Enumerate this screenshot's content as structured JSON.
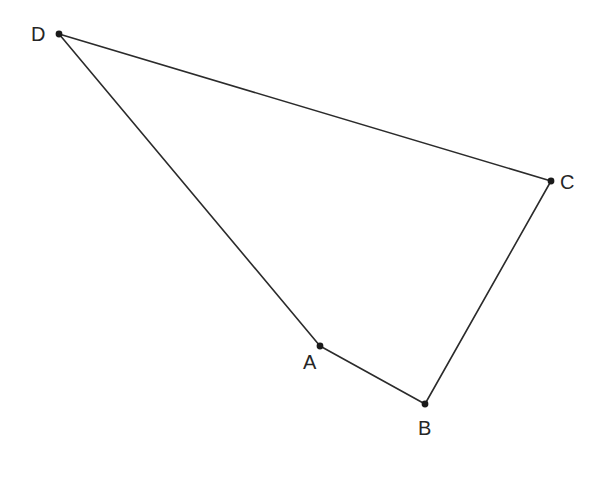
{
  "figure": {
    "background_color": "#ffffff",
    "stroke_color": "#2b2b2b",
    "stroke_width": 1.6,
    "vertex_dot_color": "#1a1a1a",
    "vertex_dot_radius": 3.4,
    "label_color": "#262626",
    "label_font_size": 20,
    "canvas": {
      "width": 604,
      "height": 477
    },
    "vertices": [
      {
        "id": "D",
        "label": "D",
        "x": 59,
        "y": 34,
        "label_x": 31,
        "label_y": 24,
        "label_position": "left"
      },
      {
        "id": "C",
        "label": "C",
        "x": 551,
        "y": 181,
        "label_x": 560,
        "label_y": 172,
        "label_position": "right"
      },
      {
        "id": "B",
        "label": "B",
        "x": 425,
        "y": 404,
        "label_x": 418,
        "label_y": 418,
        "label_position": "below"
      },
      {
        "id": "A",
        "label": "A",
        "x": 320,
        "y": 346,
        "label_x": 303,
        "label_y": 352,
        "label_position": "below-left"
      }
    ],
    "edges": [
      {
        "id": "DC",
        "from": "D",
        "to": "C",
        "x1": 59,
        "y1": 34,
        "x2": 551,
        "y2": 181
      },
      {
        "id": "CB",
        "from": "C",
        "to": "B",
        "x1": 551,
        "y1": 181,
        "x2": 425,
        "y2": 404
      },
      {
        "id": "BA",
        "from": "B",
        "to": "A",
        "x1": 425,
        "y1": 404,
        "x2": 320,
        "y2": 346
      },
      {
        "id": "AD",
        "from": "A",
        "to": "D",
        "x1": 320,
        "y1": 346,
        "x2": 59,
        "y2": 34
      }
    ]
  }
}
